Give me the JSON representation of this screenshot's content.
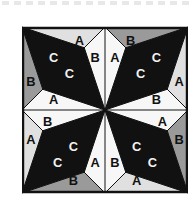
{
  "figure": {
    "canvas": {
      "width": 196,
      "height": 206,
      "background": "#ffffff"
    },
    "border_dashes": {
      "name": "dashed-strip",
      "count": 16,
      "color": "#e8e8e8"
    },
    "pattern": {
      "x": 22,
      "y": 26,
      "width": 166,
      "height": 168,
      "outline_color": "#111111",
      "grid_color": "#111111"
    }
  },
  "palette": {
    "black": "#111111",
    "white": "#f7f7f7",
    "light_gray": "#e0e0e0",
    "mid_gray": "#9a9a9a",
    "dark_label": "#111111",
    "light_label": "#f2f2f2"
  },
  "legend": {
    "labels": [
      "A",
      "B",
      "C"
    ],
    "A": "A",
    "B": "B",
    "C": "C"
  },
  "quadrants": [
    {
      "name": "top-left",
      "rotation": 0,
      "labels": [
        {
          "text": "C",
          "tone": "light"
        },
        {
          "text": "C",
          "tone": "light"
        },
        {
          "text": "A",
          "tone": "dark"
        },
        {
          "text": "B",
          "tone": "dark"
        },
        {
          "text": "B",
          "tone": "dark"
        },
        {
          "text": "A",
          "tone": "dark"
        }
      ]
    },
    {
      "name": "top-right",
      "rotation": 90,
      "labels": [
        {
          "text": "C",
          "tone": "light"
        },
        {
          "text": "C",
          "tone": "light"
        },
        {
          "text": "A",
          "tone": "dark"
        },
        {
          "text": "B",
          "tone": "dark"
        },
        {
          "text": "B",
          "tone": "dark"
        },
        {
          "text": "A",
          "tone": "dark"
        }
      ]
    },
    {
      "name": "bottom-left",
      "rotation": 270,
      "labels": [
        {
          "text": "C",
          "tone": "light"
        },
        {
          "text": "C",
          "tone": "light"
        },
        {
          "text": "A",
          "tone": "dark"
        },
        {
          "text": "B",
          "tone": "dark"
        },
        {
          "text": "B",
          "tone": "dark"
        },
        {
          "text": "A",
          "tone": "dark"
        }
      ]
    },
    {
      "name": "bottom-right",
      "rotation": 180,
      "labels": [
        {
          "text": "C",
          "tone": "light"
        },
        {
          "text": "C",
          "tone": "light"
        },
        {
          "text": "A",
          "tone": "dark"
        },
        {
          "text": "B",
          "tone": "dark"
        },
        {
          "text": "B",
          "tone": "dark"
        },
        {
          "text": "A",
          "tone": "dark"
        }
      ]
    }
  ],
  "letters": {
    "tl": {
      "c1": "C",
      "c2": "C",
      "a_top": "A",
      "b_right": "B",
      "b_left": "B",
      "a_bottom": "A"
    },
    "tr": {
      "c1": "C",
      "c2": "C",
      "a_top": "A",
      "b_right": "B",
      "b_left": "B",
      "a_bottom": "A"
    },
    "bl": {
      "c1": "C",
      "c2": "C",
      "a_top": "A",
      "b_right": "B",
      "b_left": "B",
      "a_bottom": "A"
    },
    "br": {
      "c1": "C",
      "c2": "C",
      "a_top": "A",
      "b_right": "B",
      "b_left": "B",
      "a_bottom": "A"
    }
  }
}
